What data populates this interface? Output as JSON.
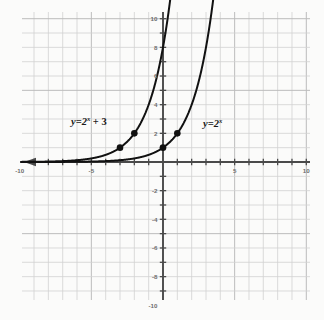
{
  "chart_data": {
    "type": "line",
    "title": "",
    "xlabel": "",
    "ylabel": "",
    "xlim": [
      -10.2,
      10.2
    ],
    "ylim": [
      -10.4,
      10.4
    ],
    "grid": true,
    "grid_step": 1,
    "legend_position": "inline-annotations",
    "x_tick_labels": [
      "-10",
      "-5",
      "5",
      "10"
    ],
    "x_tick_values": [
      -10,
      -5,
      5,
      10
    ],
    "y_tick_labels": [
      "10",
      "8",
      "6",
      "4",
      "2",
      "-2",
      "-4",
      "-6",
      "-8",
      "-10"
    ],
    "y_tick_values": [
      10,
      8,
      6,
      4,
      2,
      -2,
      -4,
      -6,
      -8,
      -10
    ],
    "x_axis_arrow": "left",
    "series": [
      {
        "name": "y=2^x + 3",
        "label_text": "y=2",
        "label_exponent": "x",
        "label_suffix": " + 3",
        "expression": "y = 2^(x+3)",
        "color": "#111111",
        "points": [
          {
            "x": -3,
            "y": 1
          },
          {
            "x": -2,
            "y": 2
          }
        ]
      },
      {
        "name": "y=2^x",
        "label_text": "y=2",
        "label_exponent": "x",
        "label_suffix": "",
        "expression": "y = 2^x",
        "color": "#111111",
        "points": [
          {
            "x": 0,
            "y": 1
          },
          {
            "x": 1,
            "y": 2
          }
        ]
      }
    ],
    "colors": {
      "background": "#fbfbfa",
      "grid_minor": "#d2d2d2",
      "grid_major": "#bcbcbc",
      "axis": "#4a4a4a",
      "curve": "#111111",
      "marker": "#111111",
      "tick_text": "#6d6d6d"
    }
  },
  "labels": {
    "left_curve": {
      "base": "y=2",
      "exponent": "x",
      "suffix": " + 3"
    },
    "right_curve": {
      "base": "y=2",
      "exponent": "x",
      "suffix": ""
    }
  }
}
